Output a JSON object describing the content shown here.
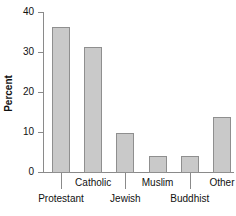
{
  "chart_data": {
    "type": "bar",
    "title": "",
    "xlabel": "",
    "ylabel": "Percent",
    "categories": [
      "Protestant",
      "Catholic",
      "Jewish",
      "Muslim",
      "Buddhist",
      "Other"
    ],
    "values": [
      36.5,
      31.6,
      10.1,
      4.2,
      4.2,
      14.1
    ],
    "ylim": [
      0,
      40
    ],
    "yticks": [
      0,
      10,
      20,
      30,
      40
    ],
    "ytick_labels": [
      "0",
      "10",
      "20",
      "30",
      "40"
    ],
    "grid": false,
    "legend": null,
    "bar_fill_color": "#c9c9c9",
    "bar_edge_color": "#8f8f8f",
    "axis_color": "#8a8a8a",
    "text_color": "#111111",
    "label_rows": [
      1,
      0,
      1,
      0,
      1,
      0
    ]
  }
}
